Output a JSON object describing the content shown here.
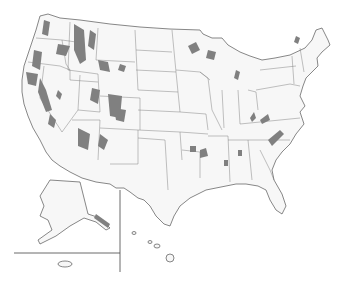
{
  "map": {
    "title": "",
    "subject": "United States with shaded land areas",
    "colors": {
      "land": "#f7f7f7",
      "boundary": "#555555",
      "shaded": "#808080",
      "background": "#ffffff"
    },
    "insets": [
      "Alaska",
      "Hawaii",
      "Puerto Rico"
    ],
    "legend": null
  }
}
